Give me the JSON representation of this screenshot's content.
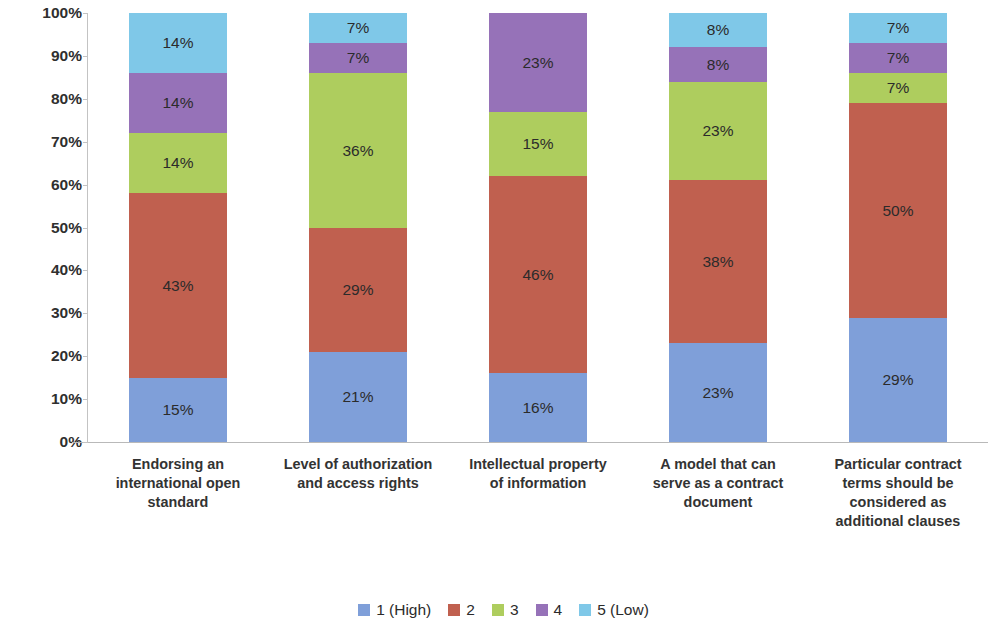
{
  "chart_data": {
    "type": "bar",
    "subtype": "100% stacked column",
    "title": "",
    "subtitle": "",
    "xlabel": "",
    "ylabel": "",
    "ylim": [
      0,
      100
    ],
    "grid": false,
    "legend_position": "bottom",
    "value_suffix": "%",
    "categories": [
      "Endorsing an international open standard",
      "Level of authorization and access rights",
      "Intellectual property of information",
      "A model that can serve as a contract document",
      "Particular contract terms should be considered as additional clauses"
    ],
    "category_lines": [
      [
        "Endorsing an",
        "international open",
        "standard"
      ],
      [
        "Level of authorization",
        "and access rights"
      ],
      [
        "Intellectual property",
        "of information"
      ],
      [
        "A model that can",
        "serve as a contract",
        "document"
      ],
      [
        "Particular contract",
        "terms should be",
        "considered as",
        "additional clauses"
      ]
    ],
    "series": [
      {
        "name": "1 (High)",
        "color": "#7f9fd9",
        "values": [
          15,
          21,
          16,
          23,
          29
        ]
      },
      {
        "name": "2",
        "color": "#c0604f",
        "values": [
          43,
          29,
          46,
          38,
          50
        ]
      },
      {
        "name": "3",
        "color": "#aecd5e",
        "values": [
          14,
          36,
          15,
          23,
          7
        ]
      },
      {
        "name": "4",
        "color": "#9672b8",
        "values": [
          14,
          7,
          23,
          8,
          7
        ]
      },
      {
        "name": "5 (Low)",
        "color": "#7fc8e8",
        "values": [
          14,
          7,
          0,
          8,
          7
        ]
      }
    ],
    "data_labels": [
      [
        "15%",
        "43%",
        "14%",
        "14%",
        "14%"
      ],
      [
        "21%",
        "29%",
        "36%",
        "7%",
        "7%"
      ],
      [
        "16%",
        "46%",
        "15%",
        "23%",
        ""
      ],
      [
        "23%",
        "38%",
        "23%",
        "8%",
        "8%"
      ],
      [
        "29%",
        "50%",
        "7%",
        "7%",
        "7%"
      ]
    ],
    "y_ticks": [
      "0%",
      "10%",
      "20%",
      "30%",
      "40%",
      "50%",
      "60%",
      "70%",
      "80%",
      "90%",
      "100%"
    ],
    "y_tick_values": [
      0,
      10,
      20,
      30,
      40,
      50,
      60,
      70,
      80,
      90,
      100
    ],
    "legend": [
      {
        "label": "1 (High)",
        "color": "#7f9fd9"
      },
      {
        "label": "2",
        "color": "#c0604f"
      },
      {
        "label": "3",
        "color": "#aecd5e"
      },
      {
        "label": "4",
        "color": "#9672b8"
      },
      {
        "label": "5 (Low)",
        "color": "#7fc8e8"
      }
    ],
    "colors": {
      "axis": "#c3c3c3",
      "text": "#2f2f2f",
      "background": "#ffffff"
    }
  }
}
